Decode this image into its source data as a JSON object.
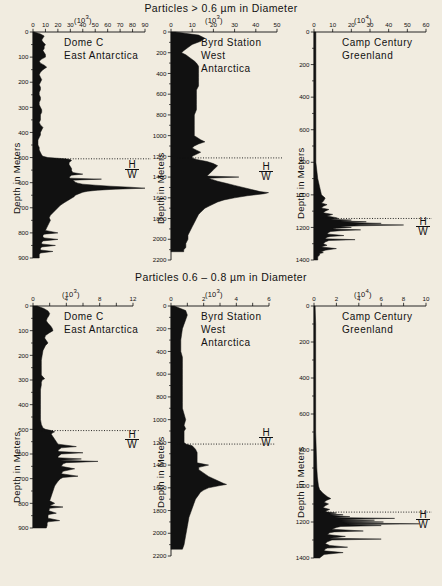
{
  "titles": {
    "top": "Particles  >  0.6 µm  in  Diameter",
    "bottom": "Particles  0.6 – 0.8 µm  in  Diameter"
  },
  "axis_titles": {
    "depth": "Depth in Meters"
  },
  "marker": {
    "h": "H",
    "w": "W"
  },
  "sites": {
    "dome_c": {
      "line1": "Dome C",
      "line2": "East Antarctica"
    },
    "byrd": {
      "line1": "Byrd Station",
      "line2": "West",
      "line3": "Antarctica"
    },
    "camp": {
      "line1": "Camp Century",
      "line2": "Greenland"
    }
  },
  "chart_data": [
    {
      "id": "top-dome-c",
      "type": "area",
      "title": "Dome C East Antarctica",
      "panel_group": "Particles > 0.6 µm in Diameter",
      "xlabel": "(10³)",
      "x_exponent": 3,
      "ylabel": "Depth in Meters",
      "xlim": [
        0,
        90
      ],
      "ylim": [
        0,
        900
      ],
      "xticks": [
        0,
        10,
        20,
        30,
        40,
        50,
        60,
        70,
        80,
        90
      ],
      "xtick_labels": [
        "0",
        "10",
        "20",
        "30",
        "40",
        "50",
        "60",
        "70",
        "80",
        "90"
      ],
      "yticks": [
        0,
        100,
        200,
        300,
        400,
        500,
        600,
        700,
        800,
        900
      ],
      "ytick_labels": [
        "0",
        "100",
        "200",
        "300",
        "400",
        "500",
        "600",
        "700",
        "800",
        "900"
      ],
      "grid": false,
      "hw_depth": 505,
      "depth": [
        0,
        8,
        16,
        24,
        32,
        40,
        50,
        58,
        66,
        74,
        82,
        90,
        100,
        108,
        116,
        124,
        132,
        140,
        150,
        160,
        170,
        180,
        190,
        200,
        210,
        220,
        230,
        240,
        250,
        260,
        270,
        280,
        290,
        300,
        310,
        320,
        330,
        340,
        350,
        360,
        370,
        380,
        390,
        400,
        410,
        420,
        430,
        440,
        450,
        460,
        470,
        480,
        490,
        495,
        500,
        505,
        508,
        512,
        516,
        520,
        528,
        536,
        544,
        552,
        560,
        566,
        570,
        574,
        578,
        582,
        586,
        590,
        594,
        598,
        602,
        606,
        610,
        614,
        618,
        622,
        626,
        630,
        634,
        638,
        642,
        646,
        650,
        656,
        662,
        668,
        674,
        680,
        690,
        700,
        710,
        720,
        730,
        740,
        750,
        760,
        770,
        780,
        790,
        800,
        805,
        810,
        815,
        820,
        826,
        832,
        838,
        844,
        850,
        856,
        862,
        868,
        874,
        880,
        886,
        892,
        900
      ],
      "value": [
        1,
        6,
        9,
        8,
        7,
        8,
        10,
        9,
        9,
        8,
        9,
        10,
        10,
        7,
        5,
        6,
        9,
        11,
        8,
        6,
        5,
        6,
        7,
        6,
        5,
        6,
        6,
        5,
        5,
        6,
        6,
        5,
        5,
        6,
        7,
        7,
        6,
        6,
        6,
        5,
        6,
        8,
        7,
        6,
        6,
        5,
        4,
        4,
        4,
        5,
        5,
        6,
        7,
        8,
        12,
        26,
        30,
        31,
        30,
        29,
        29,
        30,
        31,
        31,
        32,
        40,
        31,
        30,
        29,
        30,
        55,
        32,
        33,
        34,
        36,
        40,
        50,
        62,
        78,
        90,
        66,
        52,
        44,
        40,
        38,
        36,
        34,
        33,
        31,
        29,
        27,
        25,
        22,
        20,
        18,
        16,
        14,
        13,
        14,
        13,
        12,
        11,
        10,
        20,
        9,
        8,
        8,
        9,
        20,
        8,
        7,
        7,
        18,
        7,
        6,
        6,
        16,
        6,
        5,
        5,
        5
      ]
    },
    {
      "id": "top-byrd",
      "type": "area",
      "title": "Byrd Station West Antarctica",
      "panel_group": "Particles > 0.6 µm in Diameter",
      "xlabel": "(10³)",
      "x_exponent": 3,
      "ylabel": "Depth in Meters",
      "xlim": [
        0,
        50
      ],
      "ylim": [
        0,
        2200
      ],
      "xticks": [
        0,
        10,
        20,
        30,
        40,
        50
      ],
      "xtick_labels": [
        "0",
        "10",
        "20",
        "30",
        "40",
        "50"
      ],
      "yticks": [
        0,
        200,
        400,
        600,
        800,
        1000,
        1200,
        1400,
        1600,
        1800,
        2000,
        2200
      ],
      "ytick_labels": [
        "0",
        "200",
        "400",
        "600",
        "800",
        "1000",
        "1200",
        "1400",
        "1600",
        "1800",
        "2000",
        "2200"
      ],
      "grid": false,
      "hw_depth": 1215,
      "depth": [
        0,
        30,
        60,
        90,
        120,
        150,
        180,
        200,
        220,
        250,
        280,
        300,
        330,
        360,
        400,
        440,
        480,
        520,
        560,
        600,
        650,
        700,
        750,
        800,
        850,
        900,
        950,
        1000,
        1040,
        1060,
        1080,
        1100,
        1120,
        1140,
        1160,
        1180,
        1200,
        1215,
        1230,
        1250,
        1270,
        1290,
        1310,
        1330,
        1350,
        1370,
        1390,
        1400,
        1410,
        1420,
        1440,
        1460,
        1480,
        1500,
        1520,
        1540,
        1550,
        1560,
        1570,
        1580,
        1600,
        1620,
        1640,
        1660,
        1680,
        1700,
        1720,
        1740,
        1760,
        1800,
        1840,
        1880,
        1920,
        1960,
        2000,
        2040,
        2080,
        2100,
        2120
      ],
      "value": [
        2,
        13,
        16,
        14,
        10,
        8,
        6,
        5,
        7,
        9,
        11,
        12,
        13,
        13,
        13,
        13,
        13,
        13,
        12,
        12,
        12,
        12,
        12,
        11,
        11,
        11,
        11,
        11,
        14,
        16,
        13,
        11,
        10,
        12,
        14,
        12,
        10,
        10,
        12,
        17,
        20,
        22,
        21,
        20,
        19,
        18,
        17,
        32,
        18,
        19,
        22,
        26,
        30,
        34,
        38,
        42,
        46,
        44,
        40,
        36,
        30,
        25,
        22,
        20,
        18,
        16,
        15,
        14,
        13,
        12,
        11,
        10,
        9,
        8,
        8,
        7,
        7,
        6,
        6
      ]
    },
    {
      "id": "top-camp-century",
      "type": "area",
      "title": "Camp Century Greenland",
      "panel_group": "Particles > 0.6 µm in Diameter",
      "xlabel": "(10⁴)",
      "x_exponent": 4,
      "ylabel": "Depth in Meters",
      "xlim": [
        0,
        60
      ],
      "ylim": [
        0,
        1400
      ],
      "xticks": [
        0,
        10,
        20,
        30,
        40,
        50,
        60
      ],
      "xtick_labels": [
        "0",
        "10",
        "20",
        "30",
        "40",
        "50",
        "60"
      ],
      "yticks": [
        0,
        200,
        400,
        600,
        800,
        1000,
        1200,
        1400
      ],
      "ytick_labels": [
        "0",
        "200",
        "400",
        "600",
        "800",
        "1000",
        "1200",
        "1400"
      ],
      "grid": false,
      "hw_depth": 1145,
      "depth": [
        0,
        50,
        100,
        200,
        300,
        400,
        500,
        600,
        700,
        800,
        900,
        950,
        1000,
        1020,
        1040,
        1050,
        1060,
        1070,
        1080,
        1090,
        1100,
        1110,
        1120,
        1130,
        1140,
        1145,
        1150,
        1155,
        1160,
        1165,
        1170,
        1175,
        1180,
        1185,
        1190,
        1195,
        1200,
        1205,
        1210,
        1215,
        1220,
        1225,
        1230,
        1240,
        1250,
        1255,
        1260,
        1270,
        1275,
        1280,
        1290,
        1300,
        1310,
        1315,
        1320,
        1330,
        1340,
        1350,
        1355,
        1360,
        1370,
        1380,
        1390,
        1400
      ],
      "value": [
        1,
        1,
        1,
        1,
        1,
        1,
        1,
        1,
        1,
        1,
        2,
        3,
        4,
        6,
        5,
        4,
        7,
        5,
        4,
        8,
        6,
        5,
        10,
        7,
        12,
        13,
        9,
        20,
        14,
        28,
        18,
        36,
        22,
        48,
        25,
        14,
        20,
        12,
        10,
        25,
        14,
        9,
        8,
        7,
        16,
        9,
        7,
        6,
        22,
        8,
        6,
        5,
        7,
        5,
        4,
        12,
        6,
        4,
        5,
        3,
        3,
        2,
        2,
        2
      ]
    },
    {
      "id": "bottom-dome-c",
      "type": "area",
      "title": "Dome C East Antarctica",
      "panel_group": "Particles 0.6 – 0.8 µm in Diameter",
      "xlabel": "(10³)",
      "x_exponent": 3,
      "ylabel": "Depth in Meters",
      "xlim": [
        0,
        12
      ],
      "ylim": [
        0,
        900
      ],
      "xticks": [
        0,
        2,
        4,
        6,
        8,
        10,
        12
      ],
      "xtick_labels": [
        "0",
        "",
        "4",
        "",
        "8",
        "",
        "12"
      ],
      "yticks": [
        0,
        100,
        200,
        300,
        400,
        500,
        600,
        700,
        800,
        900
      ],
      "ytick_labels": [
        "0",
        "100",
        "200",
        "300",
        "400",
        "500",
        "600",
        "700",
        "800",
        "900"
      ],
      "grid": false,
      "hw_depth": 505,
      "depth": [
        0,
        10,
        20,
        30,
        40,
        50,
        60,
        70,
        80,
        90,
        100,
        110,
        120,
        130,
        140,
        150,
        160,
        180,
        200,
        220,
        240,
        260,
        280,
        295,
        300,
        310,
        320,
        340,
        360,
        380,
        400,
        420,
        440,
        460,
        480,
        495,
        500,
        505,
        510,
        515,
        520,
        530,
        540,
        550,
        560,
        570,
        575,
        580,
        585,
        590,
        595,
        600,
        605,
        610,
        615,
        620,
        625,
        630,
        635,
        640,
        650,
        660,
        670,
        680,
        690,
        695,
        700,
        710,
        720,
        730,
        740,
        750,
        760,
        770,
        780,
        790,
        800,
        810,
        815,
        820,
        830,
        840,
        845,
        850,
        860,
        870,
        875,
        880,
        890,
        900
      ],
      "value": [
        0.5,
        1.3,
        1.8,
        2.0,
        1.9,
        1.7,
        1.6,
        1.8,
        2.1,
        2.3,
        2.4,
        1.9,
        1.5,
        1.4,
        1.6,
        1.8,
        1.5,
        1.2,
        1.1,
        1.0,
        1.0,
        1.0,
        1.0,
        1.4,
        1.1,
        1.0,
        1.0,
        0.9,
        0.9,
        0.9,
        0.9,
        0.9,
        0.9,
        0.9,
        1.0,
        1.2,
        1.5,
        2.2,
        2.6,
        2.3,
        2.2,
        2.4,
        2.6,
        2.8,
        3.0,
        5.2,
        3.4,
        3.2,
        3.0,
        3.1,
        6.0,
        3.4,
        3.2,
        3.0,
        3.0,
        5.8,
        3.3,
        7.8,
        4.0,
        3.6,
        3.4,
        5.0,
        3.6,
        3.4,
        5.4,
        3.6,
        3.3,
        3.0,
        2.8,
        2.6,
        2.5,
        2.4,
        2.3,
        2.2,
        2.1,
        2.0,
        2.6,
        2.0,
        3.6,
        2.0,
        1.9,
        2.8,
        1.9,
        1.8,
        1.8,
        3.2,
        1.8,
        1.7,
        1.7,
        1.6
      ]
    },
    {
      "id": "bottom-byrd",
      "type": "area",
      "title": "Byrd Station West Antarctica",
      "panel_group": "Particles 0.6 – 0.8 µm in Diameter",
      "xlabel": "(10³)",
      "x_exponent": 3,
      "ylabel": "Depth in Meters",
      "xlim": [
        0,
        6
      ],
      "ylim": [
        0,
        2200
      ],
      "xticks": [
        0,
        1,
        2,
        3,
        4,
        5,
        6
      ],
      "xtick_labels": [
        "0",
        "",
        "2",
        "",
        "4",
        "",
        "6"
      ],
      "yticks": [
        0,
        200,
        400,
        600,
        800,
        1000,
        1200,
        1400,
        1600,
        1800,
        2000,
        2200
      ],
      "ytick_labels": [
        "0",
        "200",
        "400",
        "600",
        "800",
        "1000",
        "1200",
        "1400",
        "1600",
        "1800",
        "2000",
        "2200"
      ],
      "grid": false,
      "hw_depth": 1215,
      "depth": [
        0,
        40,
        80,
        120,
        160,
        200,
        250,
        300,
        350,
        400,
        450,
        500,
        550,
        600,
        650,
        700,
        750,
        800,
        850,
        900,
        950,
        1000,
        1050,
        1080,
        1100,
        1150,
        1200,
        1215,
        1230,
        1260,
        1290,
        1320,
        1350,
        1380,
        1400,
        1420,
        1440,
        1460,
        1480,
        1500,
        1520,
        1540,
        1560,
        1570,
        1580,
        1600,
        1620,
        1640,
        1660,
        1680,
        1700,
        1740,
        1780,
        1820,
        1860,
        1900,
        1940,
        1980,
        2020,
        2060,
        2100,
        2140
      ],
      "value": [
        0.2,
        0.9,
        1.0,
        0.9,
        0.8,
        0.7,
        0.65,
        0.6,
        0.6,
        0.6,
        0.7,
        0.7,
        0.7,
        0.7,
        0.7,
        0.7,
        0.7,
        0.7,
        0.7,
        0.7,
        0.8,
        0.9,
        0.8,
        0.9,
        0.8,
        0.8,
        0.8,
        0.9,
        1.3,
        1.5,
        1.6,
        1.6,
        1.6,
        1.6,
        2.3,
        1.7,
        1.7,
        1.9,
        2.1,
        2.3,
        2.6,
        2.9,
        3.2,
        3.4,
        3.0,
        2.3,
        2.0,
        1.8,
        1.7,
        1.6,
        1.5,
        1.4,
        1.3,
        1.2,
        1.1,
        1.05,
        1.0,
        0.95,
        0.9,
        0.85,
        0.8,
        0.7
      ]
    },
    {
      "id": "bottom-camp-century",
      "type": "area",
      "title": "Camp Century Greenland",
      "panel_group": "Particles 0.6 – 0.8 µm in Diameter",
      "xlabel": "(10⁴)",
      "x_exponent": 4,
      "ylabel": "Depth in Meters",
      "xlim": [
        0,
        10
      ],
      "ylim": [
        0,
        1400
      ],
      "xticks": [
        0,
        2,
        4,
        6,
        8,
        10
      ],
      "xtick_labels": [
        "0",
        "2",
        "4",
        "6",
        "8",
        "10"
      ],
      "yticks": [
        0,
        200,
        400,
        600,
        800,
        1000,
        1200,
        1400
      ],
      "ytick_labels": [
        "0",
        "200",
        "400",
        "600",
        "800",
        "1000",
        "1200",
        "1400"
      ],
      "grid": false,
      "hw_depth": 1145,
      "depth": [
        0,
        100,
        200,
        300,
        400,
        500,
        600,
        700,
        800,
        900,
        950,
        1000,
        1020,
        1040,
        1060,
        1070,
        1080,
        1090,
        1100,
        1110,
        1120,
        1130,
        1140,
        1145,
        1150,
        1155,
        1160,
        1165,
        1170,
        1175,
        1180,
        1185,
        1190,
        1195,
        1200,
        1205,
        1210,
        1215,
        1220,
        1225,
        1230,
        1240,
        1250,
        1255,
        1260,
        1270,
        1280,
        1290,
        1295,
        1300,
        1310,
        1320,
        1330,
        1340,
        1345,
        1350,
        1360,
        1370,
        1380,
        1390,
        1400
      ],
      "value": [
        0.1,
        0.15,
        0.15,
        0.15,
        0.15,
        0.15,
        0.15,
        0.15,
        0.2,
        0.25,
        0.3,
        0.4,
        0.5,
        0.8,
        1.2,
        1.5,
        1.1,
        0.9,
        1.3,
        1.0,
        0.8,
        1.4,
        1.0,
        1.2,
        2.0,
        1.4,
        2.6,
        1.6,
        3.2,
        1.8,
        7.2,
        2.2,
        5.4,
        2.4,
        6.2,
        2.6,
        9.4,
        3.0,
        6.0,
        2.4,
        2.0,
        1.6,
        4.4,
        1.8,
        1.4,
        1.2,
        2.8,
        1.4,
        6.0,
        1.6,
        1.2,
        1.0,
        1.4,
        3.0,
        1.2,
        1.0,
        0.9,
        2.6,
        0.9,
        0.7,
        0.5
      ]
    }
  ]
}
